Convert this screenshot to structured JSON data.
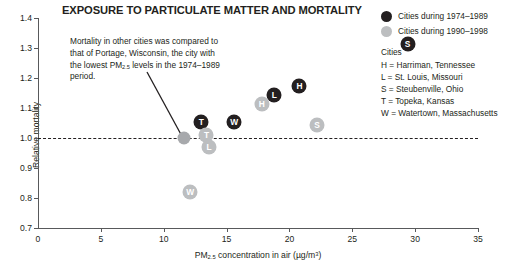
{
  "chart_data": {
    "type": "scatter",
    "title": "EXPOSURE TO PARTICULATE MATTER AND MORTALITY",
    "xlabel": "PM2.5 concentration in air (µg/m3)",
    "xlabel_prefix": "PM",
    "xlabel_sub": "2.5",
    "xlabel_mid": " concentration in air (µg/m",
    "xlabel_sup": "3",
    "xlabel_suffix": ")",
    "ylabel": "Relative mortality",
    "xlim": [
      0,
      35
    ],
    "ylim": [
      0.7,
      1.4
    ],
    "xticks": [
      0,
      5,
      10,
      15,
      20,
      25,
      30,
      35
    ],
    "yticks": [
      0.7,
      0.8,
      0.9,
      1.0,
      1.1,
      1.2,
      1.3,
      1.4
    ],
    "grid": false,
    "reference_line": {
      "y": 1.0,
      "style": "dashed",
      "color": "#231f20"
    },
    "series": [
      {
        "name": "Cities during 1974–1989",
        "color": "#231f20",
        "points": [
          {
            "label": "T",
            "city": "Topeka, Kansas",
            "x": 13.0,
            "y": 1.055
          },
          {
            "label": "W",
            "city": "Watertown, Massachusetts",
            "x": 15.6,
            "y": 1.055
          },
          {
            "label": "L",
            "city": "St. Louis, Missouri",
            "x": 18.8,
            "y": 1.145
          },
          {
            "label": "H",
            "city": "Harriman, Tennessee",
            "x": 20.8,
            "y": 1.175
          },
          {
            "label": "S",
            "city": "Steubenville, Ohio",
            "x": 29.4,
            "y": 1.315
          }
        ]
      },
      {
        "name": "Cities during 1990–1998",
        "color": "#bcbec0",
        "points": [
          {
            "label": "",
            "city": "Portage, Wisconsin",
            "x": 11.6,
            "y": 1.0
          },
          {
            "label": "T",
            "city": "Topeka, Kansas",
            "x": 13.4,
            "y": 1.01
          },
          {
            "label": "L",
            "city": "St. Louis, Missouri",
            "x": 13.6,
            "y": 0.97
          },
          {
            "label": "W",
            "city": "Watertown, Massachusetts",
            "x": 12.1,
            "y": 0.82
          },
          {
            "label": "H",
            "city": "Harriman, Tennessee",
            "x": 17.8,
            "y": 1.115
          },
          {
            "label": "S",
            "city": "Steubenville, Ohio",
            "x": 22.2,
            "y": 1.045
          }
        ]
      }
    ],
    "annotation": {
      "line1": "Mortality in other cities was compared",
      "line2": "to that of Portage, Wisconsin, the city",
      "line3_pre": "with the lowest PM",
      "line3_sub": "2.5",
      "line3_post": " levels in the",
      "line4": "1974–1989 period."
    }
  },
  "legend": {
    "entries": [
      {
        "label": "Cities during 1974–1989",
        "color": "#231f20"
      },
      {
        "label": "Cities during 1990–1998",
        "color": "#bcbec0"
      }
    ],
    "cities_heading": "Cities",
    "cities": [
      "H = Harriman, Tennessee",
      "L = St. Louis, Missouri",
      "S = Steubenville, Ohio",
      "T = Topeka, Kansas",
      "W = Watertown, Massachusetts"
    ]
  }
}
